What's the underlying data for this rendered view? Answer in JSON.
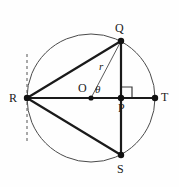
{
  "figure": {
    "canvas": {
      "width": 179,
      "height": 187
    },
    "colors": {
      "background": "#fefefe",
      "stroke_heavy": "#1a1a1a",
      "stroke_light": "#5a5a5a",
      "circle_outline": "#4a4a4a",
      "dashed_line": "#555555",
      "text": "#1a1a1a"
    },
    "circle": {
      "center_x": 91,
      "center_y": 98,
      "radius": 64,
      "stroke_width": 1
    },
    "points": {
      "O": {
        "label": "O",
        "x": 91,
        "y": 98,
        "label_x": 78,
        "label_y": 82,
        "dot": true,
        "dot_r": 2.6
      },
      "Q": {
        "label": "Q",
        "x": 121,
        "y": 41,
        "label_x": 115,
        "label_y": 22,
        "dot": true,
        "dot_r": 3.2
      },
      "R": {
        "label": "R",
        "x": 27,
        "y": 98,
        "label_x": 9,
        "label_y": 92,
        "dot": true,
        "dot_r": 3.2
      },
      "P": {
        "label": "P",
        "x": 121,
        "y": 98,
        "label_x": 118,
        "label_y": 102,
        "dot": true,
        "dot_r": 3.2
      },
      "S": {
        "label": "S",
        "x": 121,
        "y": 155,
        "label_x": 117,
        "label_y": 163,
        "dot": true,
        "dot_r": 3.2
      },
      "T": {
        "label": "T",
        "x": 155,
        "y": 98,
        "label_x": 161,
        "label_y": 91,
        "dot": true,
        "dot_r": 3.2
      }
    },
    "segments": [
      {
        "name": "segment-RT-diameter",
        "from": "R",
        "to": "T",
        "x1": 27,
        "y1": 98,
        "x2": 155,
        "y2": 98,
        "width": 2.2,
        "style": "solid"
      },
      {
        "name": "segment-RQ",
        "from": "R",
        "to": "Q",
        "x1": 27,
        "y1": 98,
        "x2": 121,
        "y2": 41,
        "width": 2.2,
        "style": "solid"
      },
      {
        "name": "segment-RS",
        "from": "R",
        "to": "S",
        "x1": 27,
        "y1": 98,
        "x2": 121,
        "y2": 155,
        "width": 2.2,
        "style": "solid"
      },
      {
        "name": "segment-QS-chord",
        "from": "Q",
        "to": "S",
        "x1": 121,
        "y1": 41,
        "x2": 121,
        "y2": 155,
        "width": 2.2,
        "style": "solid"
      },
      {
        "name": "segment-OQ-radius",
        "from": "O",
        "to": "Q",
        "x1": 91,
        "y1": 98,
        "x2": 121,
        "y2": 41,
        "width": 1,
        "style": "solid"
      }
    ],
    "tangent_line": {
      "name": "tangent-dashed-line",
      "x": 27,
      "y_top": 54,
      "y_bottom": 142,
      "width": 1,
      "dash": "3 3"
    },
    "right_angle_marker": {
      "name": "right-angle-marker-at-P",
      "vertex_x": 121,
      "vertex_y": 98,
      "size": 11,
      "direction": "up-right",
      "width": 1
    },
    "annotations": {
      "radius_label": {
        "text": "r",
        "x": 99,
        "y": 61
      },
      "angle_label": {
        "text": "θ",
        "x": 95,
        "y": 84
      }
    }
  }
}
